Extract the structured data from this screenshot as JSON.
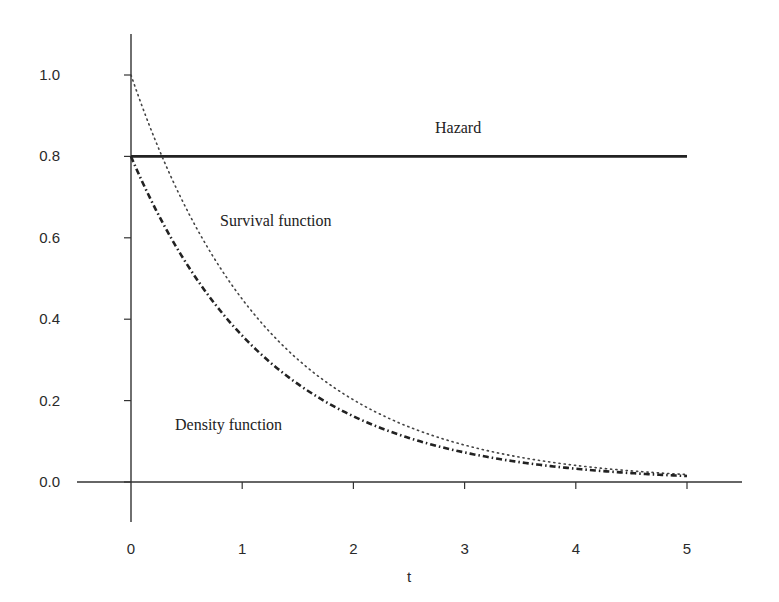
{
  "chart_data": {
    "type": "line",
    "title": "",
    "xlabel": "t",
    "ylabel": "",
    "xlim": [
      0,
      5
    ],
    "ylim": [
      0,
      1.0
    ],
    "grid": false,
    "legend": "none (inline annotations)",
    "x_ticks": [
      "0",
      "1",
      "2",
      "3",
      "4",
      "5"
    ],
    "y_ticks": [
      "0.0",
      "0.2",
      "0.4",
      "0.6",
      "0.8",
      "1.0"
    ],
    "x": [
      0,
      0.5,
      1,
      1.5,
      2,
      2.5,
      3,
      3.5,
      4,
      4.5,
      5
    ],
    "series": [
      {
        "name": "Hazard",
        "style": "solid",
        "values": [
          0.8,
          0.8,
          0.8,
          0.8,
          0.8,
          0.8,
          0.8,
          0.8,
          0.8,
          0.8,
          0.8
        ]
      },
      {
        "name": "Survival function",
        "style": "dotted",
        "values": [
          1.0,
          0.67,
          0.449,
          0.301,
          0.202,
          0.135,
          0.091,
          0.061,
          0.041,
          0.027,
          0.018
        ]
      },
      {
        "name": "Density function",
        "style": "dash-dot",
        "values": [
          0.8,
          0.536,
          0.359,
          0.241,
          0.161,
          0.108,
          0.073,
          0.049,
          0.033,
          0.022,
          0.015
        ]
      }
    ],
    "annotations": [
      {
        "text": "Hazard",
        "x": 2.75,
        "y": 0.86
      },
      {
        "text": "Survival function",
        "x": 0.8,
        "y": 0.64
      },
      {
        "text": "Density function",
        "x": 0.7,
        "y": 0.14
      }
    ]
  },
  "labels": {
    "xlabel": "t",
    "x_ticks": [
      "0",
      "1",
      "2",
      "3",
      "4",
      "5"
    ],
    "y_ticks": [
      "0.0",
      "0.2",
      "0.4",
      "0.6",
      "0.8",
      "1.0"
    ],
    "hazard": "Hazard",
    "survival": "Survival function",
    "density": "Density function"
  }
}
